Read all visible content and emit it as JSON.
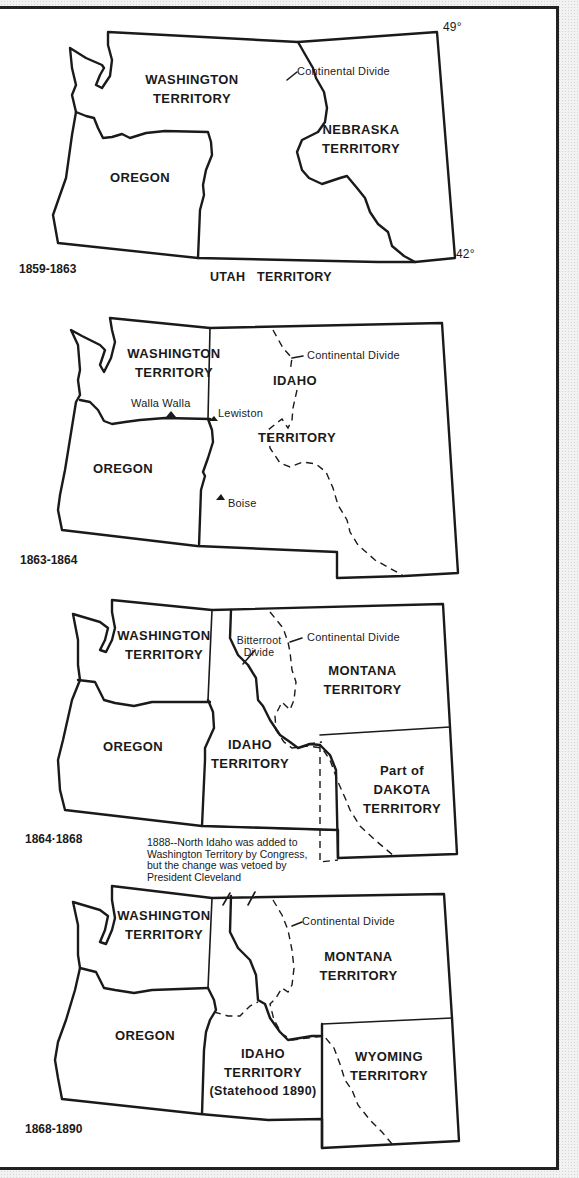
{
  "maps": [
    {
      "period": "1859-1863",
      "labels": {
        "washington": [
          "WASHINGTON",
          "TERRITORY"
        ],
        "oregon": "OREGON",
        "nebraska": [
          "NEBRASKA",
          "TERRITORY"
        ],
        "utah": "UTAH   TERRITORY",
        "continental_divide": "Continental Divide",
        "lat_north": "49°",
        "lat_south": "42°"
      }
    },
    {
      "period": "1863-1864",
      "labels": {
        "washington": [
          "WASHINGTON",
          "TERRITORY"
        ],
        "oregon": "OREGON",
        "idaho": [
          "IDAHO",
          "TERRITORY"
        ],
        "continental_divide": "Continental Divide"
      },
      "cities": [
        "Walla Walla",
        "Lewiston",
        "Boise"
      ]
    },
    {
      "period": "1864·1868",
      "labels": {
        "washington": [
          "WASHINGTON",
          "TERRITORY"
        ],
        "oregon": "OREGON",
        "idaho": [
          "IDAHO",
          "TERRITORY"
        ],
        "montana": [
          "MONTANA",
          "TERRITORY"
        ],
        "dakota": [
          "Part of",
          "DAKOTA",
          "TERRITORY"
        ],
        "bitterroot": [
          "Bitterroot",
          "Divide"
        ],
        "continental_divide": "Continental Divide"
      },
      "note": [
        "1888--North Idaho was added to",
        "Washington Territory by Congress,",
        "but the change was vetoed by",
        "President Cleveland"
      ]
    },
    {
      "period": "1868-1890",
      "labels": {
        "washington": [
          "WASHINGTON",
          "TERRITORY"
        ],
        "oregon": "OREGON",
        "idaho": [
          "IDAHO",
          "TERRITORY",
          "(Statehood  1890)"
        ],
        "montana": [
          "MONTANA",
          "TERRITORY"
        ],
        "wyoming": [
          "WYOMING",
          "TERRITORY"
        ],
        "continental_divide": "Continental Divide"
      }
    }
  ],
  "colors": {
    "ink": "#1a1a1a",
    "paper": "#ffffff",
    "backdrop": "#f2f2f2"
  }
}
